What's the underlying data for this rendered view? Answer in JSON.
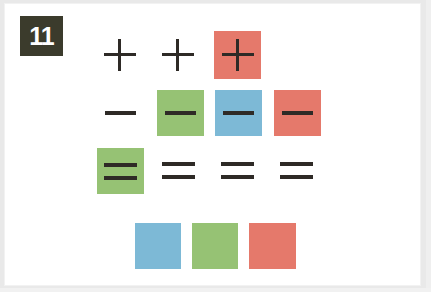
{
  "card": {
    "badge_number": "11",
    "background_color": "#ffffff",
    "frame_color": "#e9e9e9",
    "badge_color": "#3b3b2c",
    "badge_text_color": "#ffffff",
    "stroke_color": "#2e2a26"
  },
  "palette": {
    "red": "#e5796b",
    "green": "#96c274",
    "blue": "#7db9d6",
    "none": "transparent"
  },
  "rows": [
    {
      "name": "plus-row",
      "symbol": "plus",
      "y": 31,
      "cells": [
        {
          "symbol": "plus",
          "tile": "none",
          "x": 104,
          "w": 32,
          "h": 32,
          "cy": 55
        },
        {
          "symbol": "plus",
          "tile": "none",
          "x": 162,
          "w": 32,
          "h": 32,
          "cy": 55
        },
        {
          "symbol": "plus",
          "tile": "red",
          "x": 214,
          "w": 47,
          "h": 48,
          "cy": 55
        }
      ]
    },
    {
      "name": "minus-row",
      "symbol": "minus",
      "y": 90,
      "cells": [
        {
          "symbol": "minus",
          "tile": "none",
          "x": 105,
          "w": 31,
          "h": 4,
          "cy": 113
        },
        {
          "symbol": "minus",
          "tile": "green",
          "x": 157,
          "w": 47,
          "h": 46,
          "cy": 113
        },
        {
          "symbol": "minus",
          "tile": "blue",
          "x": 215,
          "w": 47,
          "h": 46,
          "cy": 113
        },
        {
          "symbol": "minus",
          "tile": "red",
          "x": 274,
          "w": 47,
          "h": 46,
          "cy": 113
        }
      ]
    },
    {
      "name": "equals-row",
      "symbol": "equals",
      "y": 148,
      "cells": [
        {
          "symbol": "equals",
          "tile": "green",
          "x": 97,
          "w": 47,
          "h": 46,
          "cy": 171
        },
        {
          "symbol": "equals",
          "tile": "none",
          "x": 162,
          "w": 33,
          "h": 17,
          "cy": 171
        },
        {
          "symbol": "equals",
          "tile": "none",
          "x": 221,
          "w": 33,
          "h": 17,
          "cy": 171
        },
        {
          "symbol": "equals",
          "tile": "none",
          "x": 280,
          "w": 33,
          "h": 17,
          "cy": 171
        }
      ]
    },
    {
      "name": "blank-row",
      "symbol": "none",
      "y": 223,
      "cells": [
        {
          "symbol": "none",
          "tile": "blue",
          "x": 135,
          "w": 46,
          "h": 46,
          "cy": 246
        },
        {
          "symbol": "none",
          "tile": "green",
          "x": 192,
          "w": 46,
          "h": 46,
          "cy": 246
        },
        {
          "symbol": "none",
          "tile": "red",
          "x": 249,
          "w": 47,
          "h": 46,
          "cy": 246
        }
      ]
    }
  ]
}
